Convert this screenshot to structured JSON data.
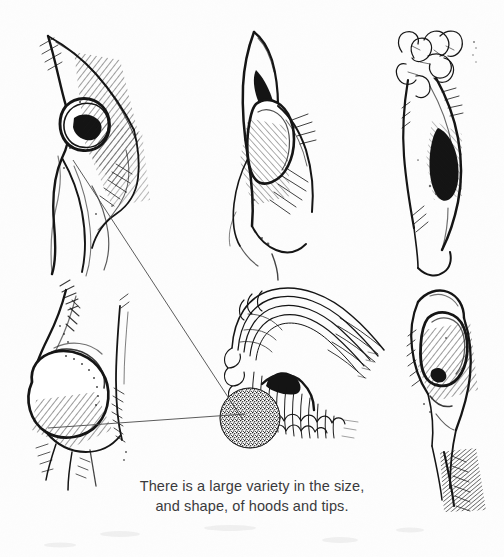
{
  "page": {
    "kind": "scanned-ink-illustration-plate",
    "background_color": "#fdfdfd",
    "ink_color": "#151515",
    "width": 504,
    "height": 557
  },
  "caption": {
    "line1": "There is a large variety in the size,",
    "line2": "and shape, of hoods and tips.",
    "color": "#3a3a3c"
  },
  "figures": [
    {
      "id": "fig-top-left",
      "name": "top-left-uncircumcised-lateral-view",
      "position": {
        "x": 20,
        "y": 25,
        "w": 130,
        "h": 245
      }
    },
    {
      "id": "fig-top-center",
      "name": "top-center-hood-frontal-view",
      "position": {
        "x": 215,
        "y": 20,
        "w": 120,
        "h": 225
      }
    },
    {
      "id": "fig-top-right",
      "name": "top-right-curled-tip-view",
      "position": {
        "x": 395,
        "y": 25,
        "w": 95,
        "h": 215
      }
    },
    {
      "id": "fig-bottom-left",
      "name": "bottom-left-rounded-tip-view",
      "position": {
        "x": 20,
        "y": 285,
        "w": 140,
        "h": 215
      }
    },
    {
      "id": "fig-bottom-center",
      "name": "bottom-center-cutaway-detail",
      "position": {
        "x": 215,
        "y": 285,
        "w": 150,
        "h": 170
      },
      "stipple": {
        "cx": 250,
        "cy": 418,
        "r": 30
      }
    },
    {
      "id": "fig-bottom-right",
      "name": "bottom-right-retracted-view",
      "position": {
        "x": 405,
        "y": 280,
        "w": 90,
        "h": 225
      }
    }
  ],
  "leader_lines": [
    {
      "id": "leader-diagonal",
      "name": "leader-line-diagonal",
      "from": {
        "x": 73,
        "y": 160
      },
      "to": {
        "x": 243,
        "y": 420
      }
    },
    {
      "id": "leader-horizontal",
      "name": "leader-line-horizontal",
      "from": {
        "x": 48,
        "y": 428
      },
      "to": {
        "x": 245,
        "y": 414
      }
    }
  ]
}
